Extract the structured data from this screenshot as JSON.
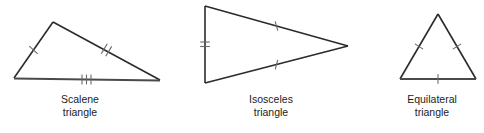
{
  "figure": {
    "background_color": "#ffffff",
    "stroke_color": "#2b2b2b",
    "tick_color": "#6a6a6a",
    "text_color": "#1c1c1c",
    "width": 484,
    "height": 133
  },
  "diagrams": [
    {
      "id": "scalene",
      "name": "Scalene triangle",
      "caption_line1": "Scalene",
      "caption_line2": "triangle",
      "vertices": {
        "apex": [
          53,
          22
        ],
        "bottom_left": [
          14,
          78
        ],
        "bottom_right": [
          160,
          80
        ]
      },
      "sides": [
        {
          "name": "left-side",
          "from": "bottom_left",
          "to": "apex",
          "tick_count": 1
        },
        {
          "name": "right-side",
          "from": "apex",
          "to": "bottom_right",
          "tick_count": 2
        },
        {
          "name": "base",
          "from": "bottom_left",
          "to": "bottom_right",
          "tick_count": 3
        }
      ]
    },
    {
      "id": "isosceles",
      "name": "Isosceles triangle",
      "caption_line1": "Isosceles",
      "caption_line2": "triangle",
      "vertices": {
        "top_left": [
          205,
          6
        ],
        "bottom_left": [
          205,
          83
        ],
        "right": [
          348,
          46
        ]
      },
      "sides": [
        {
          "name": "vertical-base",
          "from": "top_left",
          "to": "bottom_left",
          "tick_count": 2
        },
        {
          "name": "upper-side",
          "from": "top_left",
          "to": "right",
          "tick_count": 1
        },
        {
          "name": "lower-side",
          "from": "bottom_left",
          "to": "right",
          "tick_count": 1
        }
      ]
    },
    {
      "id": "equilateral",
      "name": "Equilateral triangle",
      "caption_line1": "Equilateral",
      "caption_line2": "triangle",
      "vertices": {
        "apex": [
          438,
          14
        ],
        "bottom_left": [
          400,
          79
        ],
        "bottom_right": [
          476,
          79
        ]
      },
      "sides": [
        {
          "name": "left-side",
          "from": "bottom_left",
          "to": "apex",
          "tick_count": 1
        },
        {
          "name": "right-side",
          "from": "apex",
          "to": "bottom_right",
          "tick_count": 1
        },
        {
          "name": "base",
          "from": "bottom_left",
          "to": "bottom_right",
          "tick_count": 1
        }
      ]
    }
  ]
}
